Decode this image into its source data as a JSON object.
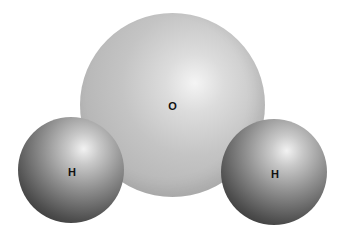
{
  "diagram": {
    "title": "",
    "atoms": [
      {
        "id": "oxygen",
        "label": "O",
        "color": "#c4c4c4"
      },
      {
        "id": "hydrogen-left",
        "label": "H",
        "color": "#6e6e6e"
      },
      {
        "id": "hydrogen-right",
        "label": "H",
        "color": "#6e6e6e"
      }
    ]
  }
}
